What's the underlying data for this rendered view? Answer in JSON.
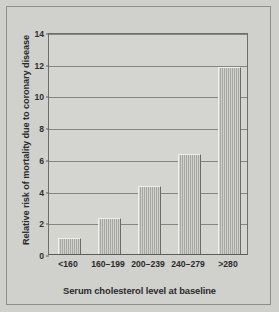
{
  "chart_data": {
    "type": "bar",
    "title": "",
    "subtitle": "",
    "xlabel": "Serum cholesterol level at baseline",
    "ylabel": "Relative risk of mortality due to coronary disease",
    "categories": [
      "<160",
      "160–199",
      "200–239",
      "240–279",
      ">280"
    ],
    "values": [
      1.0,
      2.3,
      4.3,
      6.3,
      11.8
    ],
    "ylim": [
      0,
      14
    ],
    "ytick_labels": [
      "0",
      "2",
      "4",
      "6",
      "8",
      "10",
      "12",
      "14"
    ],
    "ytick_values": [
      0,
      2,
      4,
      6,
      8,
      10,
      12,
      14
    ],
    "grid": true,
    "legend": false,
    "legend_position": "none",
    "colors": {
      "bar_fill": "#a6a6a2",
      "bar_edge": "#6a6a66",
      "plot_background": "#d4d4d1",
      "figure_background": "#cfcfcc",
      "gridline": "#86867f",
      "axis": "#5c5c58",
      "text": "#2b2b2b"
    }
  }
}
